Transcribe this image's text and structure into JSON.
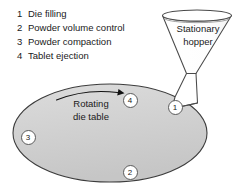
{
  "diagram": {
    "legend": [
      {
        "number": "1",
        "label": "Die filling"
      },
      {
        "number": "2",
        "label": "Powder volume control"
      },
      {
        "number": "3",
        "label": "Powder compaction"
      },
      {
        "number": "4",
        "label": "Tablet ejection"
      }
    ],
    "hopper": {
      "label_line1": "Stationary",
      "label_line2": "hopper"
    },
    "die_table": {
      "label_line1": "Rotating",
      "label_line2": "die table",
      "fill_color": "#d2d2d2",
      "stroke_color": "#3c3c3c"
    },
    "markers": [
      {
        "number": "1",
        "x": 175,
        "y": 107
      },
      {
        "number": "2",
        "x": 130,
        "y": 172
      },
      {
        "number": "3",
        "x": 28,
        "y": 137
      },
      {
        "number": "4",
        "x": 130,
        "y": 100
      }
    ],
    "rotation_arrow": {
      "direction": "clockwise-right",
      "name": "rotation-direction-arrow"
    }
  }
}
